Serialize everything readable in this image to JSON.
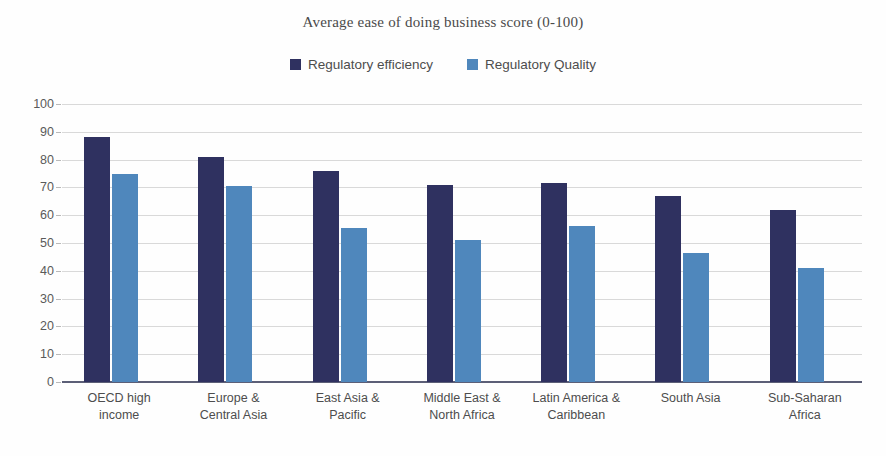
{
  "chart_data": {
    "type": "bar",
    "title": "Average ease of doing business score (0-100)",
    "xlabel": "",
    "ylabel": "",
    "ylim": [
      0,
      100
    ],
    "ytick_step": 10,
    "yticks": [
      100,
      90,
      80,
      70,
      60,
      50,
      40,
      30,
      20,
      10,
      0
    ],
    "grid": true,
    "legend_position": "top-center",
    "categories": [
      "OECD high income",
      "Europe & Central Asia",
      "East Asia & Pacific",
      "Middle East & North Africa",
      "Latin America & Caribbean",
      "South Asia",
      "Sub-Saharan Africa"
    ],
    "category_lines": [
      [
        "OECD high",
        "income"
      ],
      [
        "Europe &",
        "Central Asia"
      ],
      [
        "East Asia &",
        "Pacific"
      ],
      [
        "Middle East &",
        "North Africa"
      ],
      [
        "Latin America &",
        "Caribbean"
      ],
      [
        "South Asia",
        ""
      ],
      [
        "Sub-Saharan",
        "Africa"
      ]
    ],
    "series": [
      {
        "name": "Regulatory efficiency",
        "color": "#2f3160",
        "values": [
          88,
          81,
          76,
          71,
          71.5,
          67,
          62
        ]
      },
      {
        "name": "Regulatory Quality",
        "color": "#4f87bc",
        "values": [
          75,
          70.5,
          55.5,
          51,
          56,
          46.5,
          41
        ]
      }
    ]
  },
  "colors": {
    "series_dark": "#2f3160",
    "series_light": "#4f87bc",
    "gridline": "#d9d9d9",
    "axis_line": "#5c5f77",
    "text": "#4d4d4d",
    "background": "#fefefe"
  }
}
